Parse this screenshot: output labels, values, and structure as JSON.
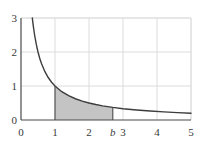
{
  "chart_data": {
    "type": "line",
    "title": "",
    "subtitle": "",
    "xlabel": "",
    "ylabel": "",
    "xlim": [
      0,
      5
    ],
    "ylim": [
      0,
      3
    ],
    "grid": true,
    "legend": null,
    "function": "y = 1/x",
    "series": [
      {
        "name": "y = 1/x",
        "color": "#3d3d3d",
        "x": [
          0.333,
          0.36,
          0.4,
          0.45,
          0.5,
          0.55,
          0.6,
          0.7,
          0.8,
          0.9,
          1.0,
          1.2,
          1.4,
          1.6,
          1.8,
          2.0,
          2.2,
          2.4,
          2.6,
          2.7,
          3.0,
          3.4,
          3.8,
          4.2,
          4.6,
          5.0
        ],
        "y": [
          3.0,
          2.778,
          2.5,
          2.222,
          2.0,
          1.818,
          1.667,
          1.429,
          1.25,
          1.111,
          1.0,
          0.833,
          0.714,
          0.625,
          0.556,
          0.5,
          0.455,
          0.417,
          0.385,
          0.37,
          0.333,
          0.294,
          0.263,
          0.238,
          0.217,
          0.2
        ]
      }
    ],
    "shaded_region": {
      "label": "area under curve from 1 to b",
      "x_start": 1,
      "x_end": 2.7,
      "fill_color": "#c4c4c4",
      "edge_color": "#4a4a4a"
    },
    "x_ticks": [
      {
        "value": 0,
        "label": "0",
        "italic": false
      },
      {
        "value": 1,
        "label": "1",
        "italic": false
      },
      {
        "value": 2,
        "label": "2",
        "italic": false
      },
      {
        "value": 2.7,
        "label": "b",
        "italic": true
      },
      {
        "value": 3,
        "label": "3",
        "italic": false
      },
      {
        "value": 4,
        "label": "4",
        "italic": false
      },
      {
        "value": 5,
        "label": "5",
        "italic": false
      }
    ],
    "y_ticks": [
      {
        "value": 0,
        "label": "0"
      },
      {
        "value": 1,
        "label": "1"
      },
      {
        "value": 2,
        "label": "2"
      },
      {
        "value": 3,
        "label": "3"
      }
    ],
    "colors": {
      "curve": "#3d3d3d",
      "axis": "#4a4a4a",
      "grid": "#dcdcdc",
      "frame": "#e8e8e8",
      "shade": "#c4c4c4",
      "text": "#3a3a3a",
      "background": "#ffffff"
    }
  }
}
